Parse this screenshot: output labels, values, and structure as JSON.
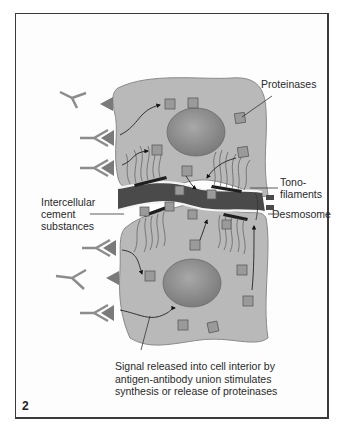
{
  "figure": {
    "number": "2",
    "colors": {
      "cell_body": "#b9b9b9",
      "cell_outline": "#8a8a8a",
      "nucleus": "#8f8f8f",
      "cement": "#4a4a4a",
      "plaque": "#1e1e1e",
      "proteinase": "#9a9a9a",
      "antibody": "#8c8c8c",
      "antigen": "#7a7a7a"
    }
  },
  "labels": {
    "proteinases": "Proteinases",
    "tonofilaments_line1": "Tono-",
    "tonofilaments_line2": "filaments",
    "intercellular_line1": "Intercellular",
    "intercellular_line2": "cement",
    "intercellular_line3": "substances",
    "desmosome": "Desmosome",
    "caption_line1": "Signal released into cell interior by",
    "caption_line2": "antigen-antibody union stimulates",
    "caption_line3": "synthesis or release of proteinases"
  }
}
